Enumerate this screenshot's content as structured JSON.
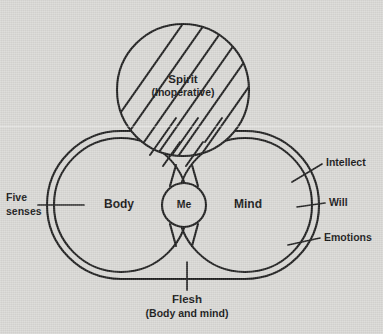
{
  "figure": {
    "background_color": "#d9d8d5",
    "ink_color": "#1d1d1d"
  },
  "labels": {
    "spirit": "Spirit",
    "spirit_note": "(Inoperative)",
    "body": "Body",
    "mind": "Mind",
    "me": "Me",
    "five_senses_line1": "Five",
    "five_senses_line2": "senses",
    "intellect": "Intellect",
    "will": "Will",
    "emotions": "Emotions",
    "flesh": "Flesh",
    "flesh_note": "(Body and mind)"
  },
  "diagram_data": {
    "type": "venn-concept-diagram",
    "circles": [
      {
        "name": "spirit",
        "label": "Spirit",
        "sublabel": "(Inoperative)",
        "cx": 183,
        "cy": 90,
        "r": 66,
        "hatched": true,
        "hatch_angle_deg": 45
      },
      {
        "name": "body",
        "label": "Body",
        "cx": 121,
        "cy": 205,
        "r": 67,
        "hatched": false
      },
      {
        "name": "mind",
        "label": "Mind",
        "cx": 245,
        "cy": 205,
        "r": 67,
        "hatched": false
      },
      {
        "name": "me",
        "label": "Me",
        "cx": 184,
        "cy": 205,
        "r": 22,
        "hatched": false
      }
    ],
    "envelope": {
      "name": "flesh",
      "label": "Flesh",
      "sublabel": "(Body and mind)",
      "description": "outer stadium outline enclosing Body and Mind"
    },
    "callouts": [
      {
        "target": "body",
        "label": "Five senses",
        "side": "left"
      },
      {
        "target": "mind",
        "label": "Intellect",
        "side": "right"
      },
      {
        "target": "mind",
        "label": "Will",
        "side": "right"
      },
      {
        "target": "mind",
        "label": "Emotions",
        "side": "right"
      },
      {
        "target": "envelope",
        "label": "Flesh",
        "side": "bottom"
      }
    ]
  }
}
